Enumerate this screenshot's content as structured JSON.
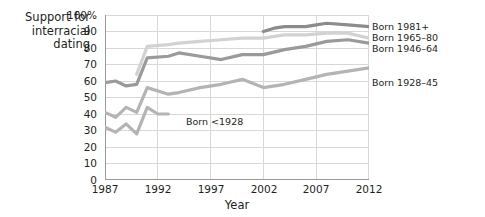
{
  "chart_data": {
    "type": "line",
    "title": "",
    "xlabel": "Year",
    "ylabel": "Support for interracial dating",
    "ylabel_lines": [
      "Support for",
      "interracial",
      "dating"
    ],
    "xlim": [
      1987,
      2012
    ],
    "ylim": [
      0,
      100
    ],
    "grid": true,
    "legend_position": "right-of-plot (series end labels)",
    "y_ticks": [
      0,
      10,
      20,
      30,
      40,
      50,
      60,
      70,
      80,
      90,
      100
    ],
    "y_tick_labels": [
      "0",
      "10",
      "20",
      "30",
      "40",
      "50",
      "60",
      "70",
      "80",
      "90",
      "100%"
    ],
    "x_ticks": [
      1987,
      1992,
      1997,
      2002,
      2007,
      2012
    ],
    "x_tick_labels": [
      "1987",
      "1992",
      "1997",
      "2002",
      "2007",
      "2012"
    ],
    "series": [
      {
        "name": "Born 1981+",
        "label": "Born 1981+",
        "color": "#8c8c8c",
        "x": [
          2002,
          2003,
          2004,
          2006,
          2007,
          2008,
          2010,
          2012
        ],
        "values": [
          90,
          92,
          93,
          93,
          94,
          95,
          94,
          93
        ]
      },
      {
        "name": "Born 1965–80",
        "label": "Born 1965–80",
        "color": "#d2d2d2",
        "x": [
          1990,
          1991,
          1993,
          1994,
          1996,
          1998,
          2000,
          2002,
          2004,
          2006,
          2008,
          2010,
          2012
        ],
        "values": [
          64,
          81,
          82,
          83,
          84,
          85,
          86,
          86,
          88,
          88,
          89,
          89,
          86
        ]
      },
      {
        "name": "Born 1946–64",
        "label": "Born 1946–64",
        "color": "#9a9a9a",
        "x": [
          1987,
          1988,
          1989,
          1990,
          1991,
          1993,
          1994,
          1996,
          1998,
          2000,
          2002,
          2004,
          2006,
          2008,
          2010,
          2012
        ],
        "values": [
          59,
          60,
          57,
          58,
          74,
          75,
          77,
          75,
          73,
          76,
          76,
          79,
          81,
          84,
          85,
          83
        ]
      },
      {
        "name": "Born 1928–45",
        "label": "Born 1928–45",
        "color": "#b4b4b4",
        "x": [
          1987,
          1988,
          1989,
          1990,
          1991,
          1993,
          1994,
          1996,
          1998,
          2000,
          2002,
          2004,
          2006,
          2008,
          2010,
          2012
        ],
        "values": [
          41,
          38,
          44,
          41,
          56,
          52,
          53,
          56,
          58,
          61,
          56,
          58,
          61,
          64,
          66,
          68
        ]
      },
      {
        "name": "Born <1928",
        "label": "Born <1928",
        "color": "#b4b4b4",
        "x": [
          1987,
          1988,
          1989,
          1990,
          1991,
          1992,
          1993
        ],
        "values": [
          32,
          29,
          34,
          28,
          44,
          40,
          40
        ]
      }
    ]
  },
  "axis": {
    "x_title": "Year"
  },
  "colors": {
    "grid": "#d8d8d8",
    "axis": "#9a9a9a",
    "text": "#231f20",
    "background": "#ffffff"
  }
}
